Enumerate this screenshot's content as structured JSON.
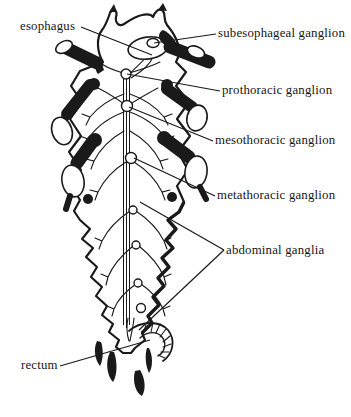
{
  "figure": {
    "type": "anatomical-line-diagram",
    "background": "#ffffff",
    "ink": "#1a1a1a",
    "labels": [
      {
        "id": "esophagus",
        "text": "esophagus",
        "x": 20,
        "y": 20,
        "side": "left"
      },
      {
        "id": "subesophageal-ganglion",
        "text": "subesophageal ganglion",
        "x": 218,
        "y": 27,
        "side": "right"
      },
      {
        "id": "prothoracic-ganglion",
        "text": "prothoracic ganglion",
        "x": 222,
        "y": 84,
        "side": "right"
      },
      {
        "id": "mesothoracic-ganglion",
        "text": "mesothoracic ganglion",
        "x": 215,
        "y": 134,
        "side": "right"
      },
      {
        "id": "metathoracic-ganglion",
        "text": "metathoracic ganglion",
        "x": 217,
        "y": 189,
        "side": "right"
      },
      {
        "id": "abdominal-ganglia",
        "text": "abdominal ganglia",
        "x": 226,
        "y": 244,
        "side": "right"
      },
      {
        "id": "rectum",
        "text": "rectum",
        "x": 21,
        "y": 359,
        "side": "left"
      }
    ],
    "leaders": [
      {
        "label": "esophagus",
        "x1": 81,
        "y1": 27,
        "x2": 152,
        "y2": 55
      },
      {
        "label": "subesophageal-ganglion",
        "x1": 216,
        "y1": 34,
        "x2": 154,
        "y2": 43
      },
      {
        "label": "prothoracic-ganglion",
        "x1": 220,
        "y1": 91,
        "x2": 127,
        "y2": 74
      },
      {
        "label": "mesothoracic-ganglion",
        "x1": 213,
        "y1": 141,
        "x2": 129,
        "y2": 107
      },
      {
        "label": "metathoracic-ganglion",
        "x1": 215,
        "y1": 196,
        "x2": 134,
        "y2": 158
      },
      {
        "label": "abdominal-ganglia",
        "x1": 224,
        "y1": 250,
        "x2": 140,
        "y2": 202
      },
      {
        "label": "abdominal-ganglia",
        "x1": 224,
        "y1": 250,
        "x2": 139,
        "y2": 330
      },
      {
        "label": "rectum",
        "x1": 60,
        "y1": 366,
        "x2": 150,
        "y2": 340
      }
    ]
  }
}
